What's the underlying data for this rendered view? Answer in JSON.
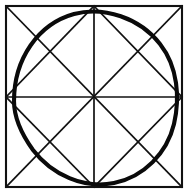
{
  "figure": {
    "background_color": "#ffffff",
    "ink_color": "#111111",
    "canvas": {
      "width": 189,
      "height": 193
    },
    "outer_square": {
      "name": "outer-square",
      "left": 6,
      "top": 6,
      "right": 182,
      "bottom": 187,
      "stroke_width": 2.1
    },
    "midpoints": {
      "top": {
        "x": 94,
        "y": 6
      },
      "right": {
        "x": 182,
        "y": 97
      },
      "bottom": {
        "x": 94,
        "y": 187
      },
      "left": {
        "x": 6,
        "y": 97
      }
    },
    "center": {
      "x": 94,
      "y": 97
    },
    "lines": [
      {
        "name": "diagonal-tl-br",
        "x1": 6,
        "y1": 6,
        "x2": 182,
        "y2": 187
      },
      {
        "name": "diagonal-tr-bl",
        "x1": 182,
        "y1": 6,
        "x2": 6,
        "y2": 187
      },
      {
        "name": "vertical-midline",
        "x1": 94,
        "y1": 6,
        "x2": 94,
        "y2": 187
      },
      {
        "name": "horizontal-midline",
        "x1": 6,
        "y1": 97,
        "x2": 182,
        "y2": 97
      },
      {
        "name": "rotated-square-top-right",
        "x1": 94,
        "y1": 6,
        "x2": 182,
        "y2": 97
      },
      {
        "name": "rotated-square-right-bottom",
        "x1": 182,
        "y1": 97,
        "x2": 94,
        "y2": 187
      },
      {
        "name": "rotated-square-bottom-left",
        "x1": 94,
        "y1": 187,
        "x2": 6,
        "y2": 97
      },
      {
        "name": "rotated-square-left-top",
        "x1": 6,
        "y1": 97,
        "x2": 94,
        "y2": 6
      }
    ],
    "circle": {
      "name": "hand-drawn-inscribed-circle",
      "stroke_width": 4.1,
      "extents": {
        "left": 14,
        "top": 11,
        "right": 178,
        "bottom": 184
      },
      "path": "M 14 101 C 14 59 38 24 74 14 C 104 6 140 18 160 44 C 178 67 180 98 174 124 C 167 153 144 177 114 183 C 84 189 52 175 33 150 C 20 132 14 117 14 101 Z"
    }
  }
}
